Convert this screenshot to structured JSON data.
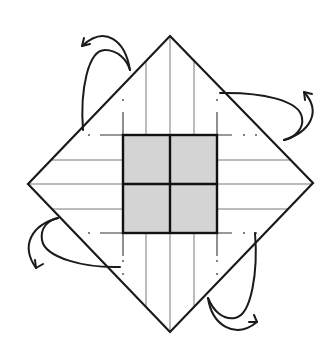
{
  "diagram": {
    "type": "origami-fold-diagram",
    "colors": {
      "background": "#ffffff",
      "outline": "#1a1a1a",
      "crease": "#555555",
      "shade": "#d4d4d4",
      "grid_border": "#111111"
    },
    "diamond": {
      "top": [
        170,
        36
      ],
      "right": [
        313,
        183
      ],
      "bottom": [
        170,
        332
      ],
      "left": [
        28,
        184
      ]
    },
    "center_square": {
      "x": 123,
      "y": 135,
      "width": 94,
      "height": 98,
      "rows": 2,
      "cols": 2,
      "fill": "#d4d4d4"
    },
    "arrows": [
      {
        "name": "fold-arrow-top-left",
        "direction": "fold-back"
      },
      {
        "name": "fold-arrow-top-right",
        "direction": "fold-back"
      },
      {
        "name": "fold-arrow-bottom-left",
        "direction": "fold-back"
      },
      {
        "name": "fold-arrow-bottom-right",
        "direction": "fold-back"
      }
    ]
  }
}
